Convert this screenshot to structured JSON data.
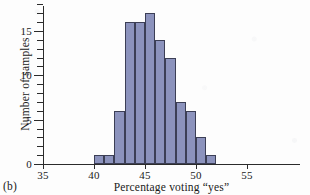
{
  "figure": {
    "panel_label": "(b)",
    "bar_fill_color": "#8c93bd",
    "bar_edge_color": "#3c3f56",
    "axis_color": "#2b2b2b",
    "background_color": "#fdfdfd"
  },
  "chart_data": {
    "type": "bar",
    "title": "",
    "subtitle": "",
    "xlabel": "Percentage voting “yes”",
    "ylabel": "Number of samples",
    "xlim": [
      35,
      58.5
    ],
    "ylim": [
      0,
      18
    ],
    "xticks": [
      35,
      40,
      45,
      50,
      55
    ],
    "xtick_labels": [
      "35",
      "40",
      "45",
      "50",
      "55"
    ],
    "yticks": [
      0,
      5,
      10,
      15
    ],
    "ytick_labels": [
      "0",
      "5",
      "10",
      "15"
    ],
    "y_minor_tick_step": 1,
    "grid": false,
    "legend": null,
    "bin_width": 1,
    "bin_edges": [
      40,
      41,
      42,
      43,
      44,
      45,
      46,
      47,
      48,
      49,
      50,
      51,
      52
    ],
    "categories": [
      "40-41",
      "41-42",
      "42-43",
      "43-44",
      "44-45",
      "45-46",
      "46-47",
      "47-48",
      "48-49",
      "49-50",
      "50-51",
      "51-52"
    ],
    "bin_starts": [
      40,
      41,
      42,
      43,
      44,
      45,
      46,
      47,
      48,
      49,
      51
    ],
    "values": [
      1,
      1,
      6,
      16,
      16,
      17,
      14,
      12,
      7,
      6,
      3,
      1
    ],
    "bars": [
      {
        "start": 40,
        "end": 41,
        "value": 1
      },
      {
        "start": 41,
        "end": 42,
        "value": 1
      },
      {
        "start": 42,
        "end": 43,
        "value": 6
      },
      {
        "start": 43,
        "end": 44,
        "value": 16
      },
      {
        "start": 44,
        "end": 45,
        "value": 16
      },
      {
        "start": 45,
        "end": 46,
        "value": 17
      },
      {
        "start": 46,
        "end": 47,
        "value": 14
      },
      {
        "start": 47,
        "end": 48,
        "value": 12
      },
      {
        "start": 48,
        "end": 49,
        "value": 7
      },
      {
        "start": 49,
        "end": 50,
        "value": 6
      },
      {
        "start": 50,
        "end": 51,
        "value": 3
      },
      {
        "start": 51,
        "end": 52,
        "value": 1
      }
    ]
  }
}
